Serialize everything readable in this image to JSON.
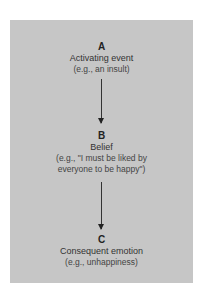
{
  "diagram": {
    "nodes": [
      {
        "letter": "A",
        "title": "Activating event",
        "example_lines": [
          "(e.g., an insult)"
        ]
      },
      {
        "letter": "B",
        "title": "Belief",
        "example_lines": [
          "(e.g., \"I must be liked by",
          "everyone to be happy\")"
        ]
      },
      {
        "letter": "C",
        "title": "Consequent emotion",
        "example_lines": [
          "(e.g., unhappiness)"
        ]
      }
    ],
    "colors": {
      "panel": "#c6c6c6",
      "arrow": "#333333"
    }
  }
}
